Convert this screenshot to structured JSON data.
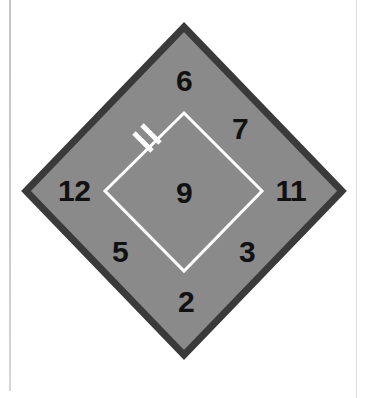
{
  "figure": {
    "canvas": {
      "width": 368,
      "height": 398,
      "background": "#ffffff"
    },
    "colors": {
      "outer_fill": "#8a8a8a",
      "outer_border": "#3a3a3a",
      "inner_stroke": "#ffffff",
      "label_color": "#111111",
      "page_rule": "#c9c9c9"
    },
    "outer_diamond": {
      "name": "outer-diamond",
      "points": "184,27 342,191 184,355 26,191",
      "border_width": 7
    },
    "inner_diamond": {
      "name": "inner-diamond",
      "points": "184,113 262,191 184,271 105,191",
      "stroke_width": 3
    },
    "tick_mark": {
      "name": "tick-mark",
      "description": "two short white bars crossing the upper-left inner edge",
      "bars": [
        {
          "x1": 134,
          "y1": 133,
          "x2": 152,
          "y2": 151
        },
        {
          "x1": 142,
          "y1": 125,
          "x2": 160,
          "y2": 143
        }
      ],
      "stroke_width": 5
    },
    "labels": [
      {
        "name": "label-top",
        "text": "6",
        "x": 184,
        "y": 81,
        "position": "top"
      },
      {
        "name": "label-upper-right",
        "text": "7",
        "x": 240,
        "y": 129,
        "position": "upper-right"
      },
      {
        "name": "label-right",
        "text": "11",
        "x": 291,
        "y": 191,
        "position": "right"
      },
      {
        "name": "label-lower-right",
        "text": "3",
        "x": 247,
        "y": 252,
        "position": "lower-right"
      },
      {
        "name": "label-bottom",
        "text": "2",
        "x": 186,
        "y": 302,
        "position": "bottom"
      },
      {
        "name": "label-lower-left",
        "text": "5",
        "x": 120,
        "y": 252,
        "position": "lower-left"
      },
      {
        "name": "label-left",
        "text": "12",
        "x": 74,
        "y": 191,
        "position": "left"
      },
      {
        "name": "label-center",
        "text": "9",
        "x": 184,
        "y": 193,
        "position": "center"
      }
    ]
  }
}
